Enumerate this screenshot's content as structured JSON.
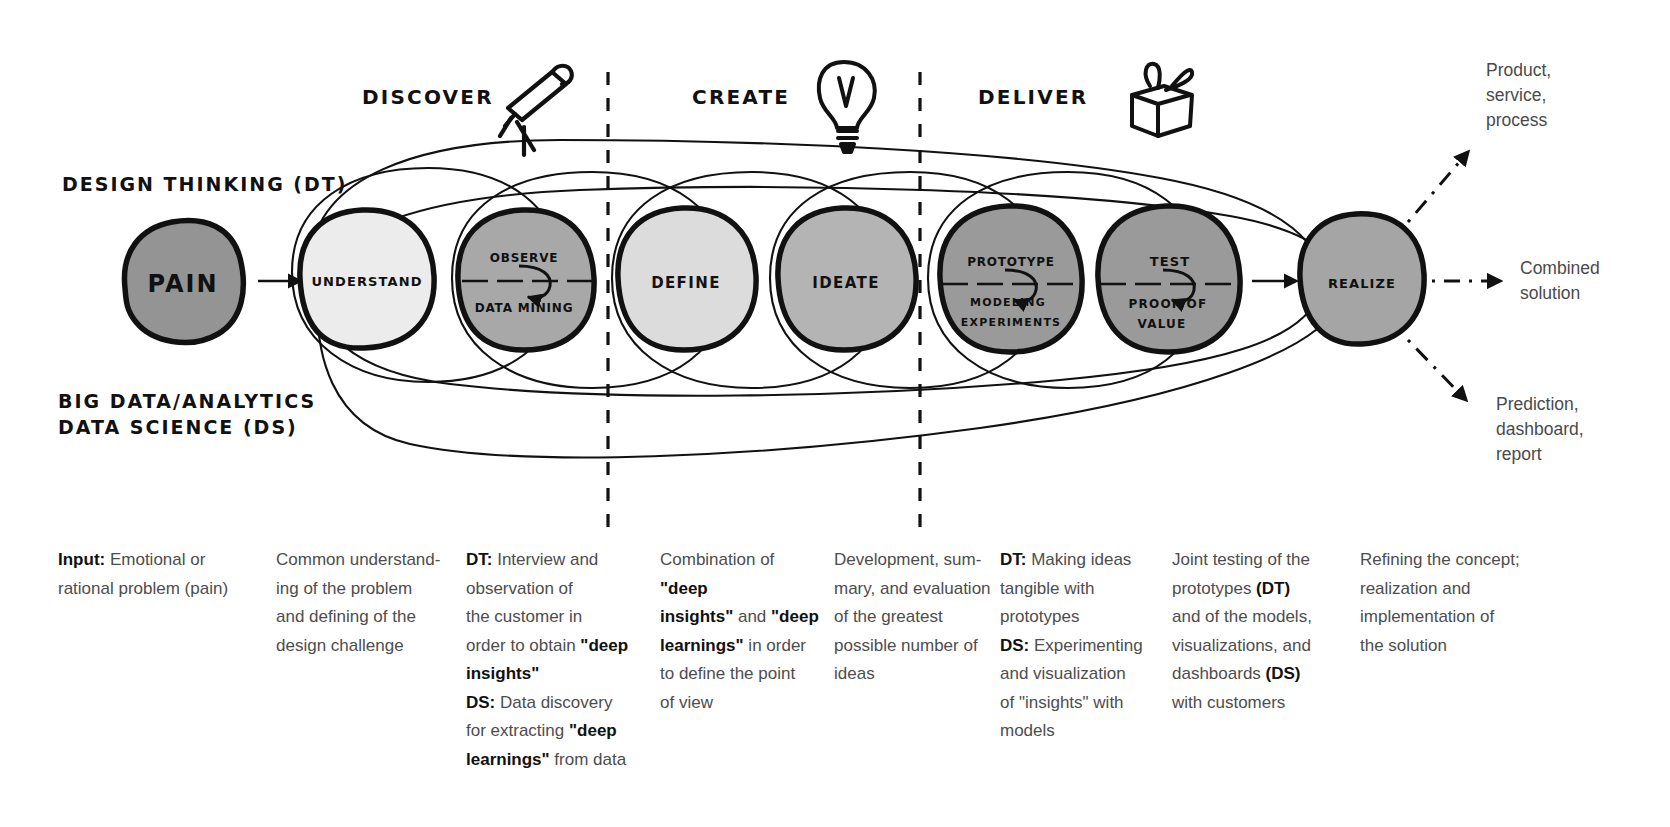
{
  "diagram": {
    "phases": [
      {
        "id": "discover",
        "label": "DISCOVER",
        "icon": "telescope-icon"
      },
      {
        "id": "create",
        "label": "CREATE",
        "icon": "lightbulb-icon"
      },
      {
        "id": "deliver",
        "label": "DELIVER",
        "icon": "gift-icon"
      }
    ],
    "track_labels": {
      "design_thinking": "DESIGN THINKING (DT)",
      "data_science_line1": "BIG DATA/ANALYTICS",
      "data_science_line2": "DATA SCIENCE (DS)"
    },
    "nodes": [
      {
        "id": "pain",
        "top": "PAIN",
        "bottom": "",
        "fill": "#949494",
        "split": false
      },
      {
        "id": "understand",
        "top": "UNDERSTAND",
        "bottom": "",
        "fill": "#ececec",
        "split": false
      },
      {
        "id": "observe",
        "top": "OBSERVE",
        "bottom": "DATA MINING",
        "fill": "#a8a8a8",
        "split": true
      },
      {
        "id": "define",
        "top": "DEFINE",
        "bottom": "",
        "fill": "#dcdcdc",
        "split": false
      },
      {
        "id": "ideate",
        "top": "IDEATE",
        "bottom": "",
        "fill": "#b4b4b4",
        "split": false
      },
      {
        "id": "prototype",
        "top": "PROTOTYPE",
        "bottom": "MODELING EXPERIMENTS",
        "fill": "#9a9a9a",
        "split": true
      },
      {
        "id": "test",
        "top": "TEST",
        "bottom": "PROOF OF VALUE",
        "fill": "#9a9a9a",
        "split": true
      },
      {
        "id": "realize",
        "top": "REALIZE",
        "bottom": "",
        "fill": "#a5a5a5",
        "split": false
      }
    ],
    "outputs": [
      {
        "id": "product",
        "lines": [
          "Product,",
          "service,",
          "process"
        ]
      },
      {
        "id": "combined",
        "lines": [
          "Combined",
          "solution"
        ]
      },
      {
        "id": "prediction",
        "lines": [
          "Prediction,",
          "dashboard,",
          "report"
        ]
      }
    ]
  },
  "columns": [
    {
      "id": "col-input",
      "html": "<b>Input:</b> Emotional or<br>rational problem (pain)"
    },
    {
      "id": "col-understand",
      "html": "Common understand-<br>ing of the problem<br>and defining of the<br>design challenge"
    },
    {
      "id": "col-observe",
      "html": "<b>DT:</b> Interview and<br>observation of<br>the customer in<br>order to obtain <span class=\"q\">&quot;deep<br>insights&quot;</span><br><b>DS:</b> Data discovery<br>for extracting <span class=\"q\">&quot;deep<br>learnings&quot;</span> from data"
    },
    {
      "id": "col-define",
      "html": "Combination of <span class=\"q\">&quot;deep<br>insights&quot;</span> and <span class=\"q\">&quot;deep<br>learnings&quot;</span> in order<br>to define the point<br>of view"
    },
    {
      "id": "col-ideate",
      "html": "Development, sum-<br>mary, and evaluation<br>of the greatest<br>possible number of<br>ideas"
    },
    {
      "id": "col-prototype",
      "html": "<b>DT:</b> Making ideas<br>tangible with<br>prototypes<br><b>DS:</b> Experimenting<br>and visualization<br>of &quot;insights&quot; with<br>models"
    },
    {
      "id": "col-test",
      "html": "Joint testing of the<br>prototypes <b>(DT)</b><br>and of the models,<br>visualizations, and<br>dashboards <b>(DS)</b><br>with customers"
    },
    {
      "id": "col-realize",
      "html": "Refining the concept;<br>realization and<br>implementation of<br>the solution"
    }
  ]
}
